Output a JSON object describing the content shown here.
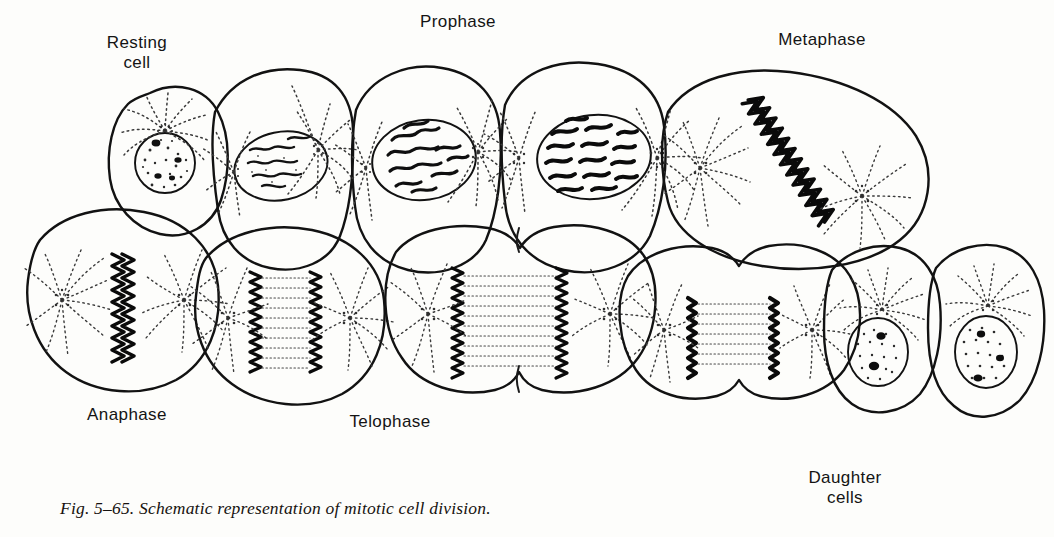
{
  "figure": {
    "caption": "Fig. 5–65.  Schematic representation of mitotic cell division.",
    "title": "Schematic representation of mitotic cell division",
    "medium": "black-and-white line drawing, stippled shading, scanned textbook page",
    "background_color": "#fdfdfb",
    "ink_color": "#121212",
    "stipple_color": "#3a3a3a"
  },
  "labels": {
    "resting_cell": "Resting\ncell",
    "prophase": "Prophase",
    "metaphase": "Metaphase",
    "anaphase": "Anaphase",
    "telophase": "Telophase",
    "daughter_cells": "Daughter\ncells"
  },
  "stages": [
    {
      "id": "resting-cell",
      "label": "Resting cell",
      "row": "top",
      "order": 1,
      "description": "Small rounded cell with a single stippled interphase nucleus and a centrosome with short radiating astral rays above the nucleus.",
      "nucleus": "stippled, intact nuclear envelope, scattered chromatin granules",
      "asters": 1,
      "chromosomes": "dispersed chromatin"
    },
    {
      "id": "early-prophase",
      "label": "Early prophase",
      "row": "top",
      "order": 2,
      "description": "Nucleus contains thin wavy chromatin threads; two asters with long dotted rays flank the nucleus.",
      "nucleus": "oval, nuclear envelope present",
      "asters": 2,
      "chromosomes": "thin threads"
    },
    {
      "id": "mid-prophase",
      "label": "Mid prophase",
      "row": "top",
      "order": 3,
      "description": "Chromatin threads thicken into distinct coiled chromosomes inside the still-intact nucleus; asters enlarge.",
      "nucleus": "oval, nuclear envelope present",
      "asters": 2,
      "chromosomes": "thickened coiled threads"
    },
    {
      "id": "late-prophase",
      "label": "Late prophase",
      "row": "top",
      "order": 4,
      "description": "Densely stained short chromosomes crowd the nucleus; asters strongly developed at both poles.",
      "nucleus": "oval, envelope breaking down",
      "asters": 2,
      "chromosomes": "short, dense, darkly stained"
    },
    {
      "id": "metaphase",
      "label": "Metaphase",
      "row": "top",
      "order": 5,
      "description": "Chromosomes aligned in a dense diagonal equatorial plate between two asters; spindle fibers converge on the poles.",
      "nucleus": "nuclear envelope absent",
      "asters": 2,
      "chromosomes": "equatorial plate"
    },
    {
      "id": "anaphase",
      "label": "Anaphase",
      "row": "bottom",
      "order": 6,
      "description": "Chromosome plate splitting; two sets of daughter chromosomes begin to move apart along the spindle.",
      "asters": 2,
      "chromosomes": "splitting plate"
    },
    {
      "id": "anaphase-late",
      "label": "Late anaphase",
      "row": "bottom",
      "order": 7,
      "description": "Two separated chromosome groups move poleward with interzonal spindle fibers stretched between them.",
      "asters": 2,
      "chromosomes": "two separating groups"
    },
    {
      "id": "telophase",
      "label": "Telophase",
      "row": "bottom",
      "order": 8,
      "description": "Daughter chromosome groups near the poles; a cleavage furrow begins to constrict the cell at the equator.",
      "asters": 2,
      "chromosomes": "two polar groups",
      "cleavage_furrow": "beginning"
    },
    {
      "id": "telophase-late",
      "label": "Late telophase",
      "row": "bottom",
      "order": 9,
      "description": "Cleavage furrow has nearly separated the two daughter cells; chromosome groups compact near each aster.",
      "asters": 2,
      "chromosomes": "compact polar groups",
      "cleavage_furrow": "nearly complete"
    },
    {
      "id": "daughter-cell-left",
      "label": "Daughter cell",
      "row": "bottom",
      "order": 10,
      "description": "Reconstituted daughter cell with a stippled nucleus containing two dark nucleoli and a centrosome with astral rays.",
      "nucleus": "stippled with 2 nucleoli",
      "asters": 1
    },
    {
      "id": "daughter-cell-right",
      "label": "Daughter cell",
      "row": "bottom",
      "order": 11,
      "description": "Second reconstituted daughter cell with a stippled nucleus, dark nucleoli and radiating astral rays.",
      "nucleus": "stippled with nucleoli",
      "asters": 1
    }
  ]
}
